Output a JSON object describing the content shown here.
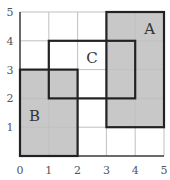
{
  "grid": {
    "xmin": 0,
    "xmax": 5,
    "ymin": 0,
    "ymax": 5
  },
  "x_ticks": [
    "0",
    "1",
    "2",
    "3",
    "4",
    "5"
  ],
  "y_ticks": [
    "1",
    "2",
    "3",
    "4",
    "5"
  ],
  "rectangles": [
    {
      "label": "A",
      "x0": 3,
      "x1": 5,
      "y0": 1,
      "y1": 5,
      "shaded": true
    },
    {
      "label": "B",
      "x0": 0,
      "x1": 2,
      "y0": 0,
      "y1": 3,
      "shaded": true
    },
    {
      "label": "C",
      "x0": 1,
      "x1": 4,
      "y0": 2,
      "y1": 4,
      "shaded": false
    }
  ],
  "colors": {
    "shade": "#c8c8c8",
    "grid": "#c0c0c0",
    "outline": "#222222"
  }
}
